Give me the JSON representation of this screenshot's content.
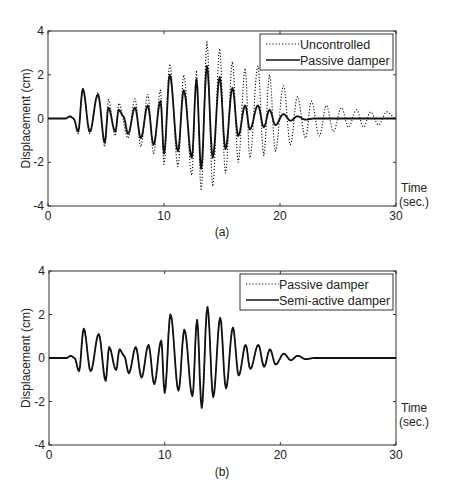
{
  "chart_data": [
    {
      "type": "line",
      "panel_label": "(a)",
      "title": "",
      "xlabel": "Time (sec.)",
      "xlabel_lines": [
        "Time",
        "(sec.)"
      ],
      "ylabel": "Displacement (cm)",
      "xlim": [
        0,
        30
      ],
      "ylim": [
        -4,
        4
      ],
      "xticks": [
        0,
        10,
        20,
        30
      ],
      "yticks": [
        -4,
        -2,
        0,
        2,
        4
      ],
      "grid": false,
      "legend_position": "upper right",
      "series": [
        {
          "name": "Uncontrolled",
          "style": "dotted",
          "peaks": [
            [
              0,
              0
            ],
            [
              1.5,
              0
            ],
            [
              1.9,
              0.1
            ],
            [
              2.2,
              0
            ],
            [
              2.6,
              -0.7
            ],
            [
              3.0,
              1.4
            ],
            [
              3.6,
              -0.7
            ],
            [
              4.3,
              1.2
            ],
            [
              4.9,
              -1.3
            ],
            [
              5.2,
              0.9
            ],
            [
              5.8,
              -0.8
            ],
            [
              6.1,
              0.7
            ],
            [
              6.9,
              -0.9
            ],
            [
              7.5,
              0.9
            ],
            [
              8.0,
              -1.3
            ],
            [
              8.6,
              1.1
            ],
            [
              9.1,
              -1.6
            ],
            [
              9.7,
              1.3
            ],
            [
              10.0,
              -2.1
            ],
            [
              10.5,
              2.5
            ],
            [
              11.2,
              -2.2
            ],
            [
              11.7,
              2.0
            ],
            [
              12.4,
              -2.6
            ],
            [
              12.8,
              2.2
            ],
            [
              13.2,
              -3.3
            ],
            [
              13.7,
              3.5
            ],
            [
              14.2,
              -3.1
            ],
            [
              14.8,
              3.2
            ],
            [
              15.3,
              -2.5
            ],
            [
              15.9,
              2.6
            ],
            [
              16.4,
              -2.0
            ],
            [
              17.0,
              2.3
            ],
            [
              17.4,
              -1.8
            ],
            [
              18.1,
              2.4
            ],
            [
              18.6,
              -1.7
            ],
            [
              19.1,
              2.0
            ],
            [
              19.6,
              -1.5
            ],
            [
              20.3,
              1.5
            ],
            [
              20.9,
              -1.2
            ],
            [
              21.5,
              1.0
            ],
            [
              22.2,
              -0.9
            ],
            [
              22.7,
              0.8
            ],
            [
              23.4,
              -0.8
            ],
            [
              24.0,
              0.6
            ],
            [
              24.6,
              -0.6
            ],
            [
              25.3,
              0.5
            ],
            [
              25.9,
              -0.4
            ],
            [
              26.6,
              0.4
            ],
            [
              27.2,
              -0.4
            ],
            [
              27.8,
              0.3
            ],
            [
              28.5,
              -0.3
            ],
            [
              29.2,
              0.3
            ],
            [
              30,
              0
            ]
          ]
        },
        {
          "name": "Passive damper",
          "style": "solid",
          "peaks": [
            [
              0,
              0
            ],
            [
              1.5,
              0
            ],
            [
              1.9,
              0.1
            ],
            [
              2.2,
              0
            ],
            [
              2.6,
              -0.6
            ],
            [
              3.0,
              1.35
            ],
            [
              3.6,
              -0.6
            ],
            [
              4.3,
              1.1
            ],
            [
              4.9,
              -1.1
            ],
            [
              5.2,
              0.5
            ],
            [
              5.8,
              -0.6
            ],
            [
              6.1,
              0.4
            ],
            [
              6.5,
              0.1
            ],
            [
              6.9,
              -0.7
            ],
            [
              7.5,
              0.5
            ],
            [
              8.0,
              -0.9
            ],
            [
              8.6,
              0.6
            ],
            [
              9.1,
              -1.2
            ],
            [
              9.7,
              0.8
            ],
            [
              10.0,
              -1.6
            ],
            [
              10.5,
              2.0
            ],
            [
              11.2,
              -1.5
            ],
            [
              11.7,
              1.3
            ],
            [
              12.4,
              -1.8
            ],
            [
              12.8,
              1.8
            ],
            [
              13.2,
              -2.3
            ],
            [
              13.7,
              2.4
            ],
            [
              14.2,
              -1.8
            ],
            [
              14.8,
              1.9
            ],
            [
              15.3,
              -1.4
            ],
            [
              15.9,
              1.4
            ],
            [
              16.4,
              -0.8
            ],
            [
              17.0,
              0.6
            ],
            [
              17.4,
              -0.5
            ],
            [
              18.1,
              0.6
            ],
            [
              18.6,
              -0.4
            ],
            [
              19.1,
              0.4
            ],
            [
              19.6,
              -0.3
            ],
            [
              20.3,
              0.2
            ],
            [
              20.9,
              -0.1
            ],
            [
              21.5,
              0.1
            ],
            [
              22.2,
              -0.05
            ],
            [
              23,
              0
            ],
            [
              30,
              0
            ]
          ]
        }
      ]
    },
    {
      "type": "line",
      "panel_label": "(b)",
      "title": "",
      "xlabel": "Time (sec.)",
      "xlabel_lines": [
        "Time",
        "(sec.)"
      ],
      "ylabel": "Displacement (cm)",
      "xlim": [
        0,
        30
      ],
      "ylim": [
        -4,
        4
      ],
      "xticks": [
        0,
        10,
        20,
        30
      ],
      "yticks": [
        -4,
        -2,
        0,
        2,
        4
      ],
      "grid": false,
      "legend_position": "upper right",
      "series": [
        {
          "name": "Passive damper",
          "style": "dotted",
          "peaks": [
            [
              0,
              0
            ],
            [
              1.5,
              0
            ],
            [
              1.9,
              0.1
            ],
            [
              2.2,
              0
            ],
            [
              2.6,
              -0.6
            ],
            [
              3.0,
              1.35
            ],
            [
              3.6,
              -0.6
            ],
            [
              4.3,
              1.1
            ],
            [
              4.9,
              -1.05
            ],
            [
              5.2,
              0.5
            ],
            [
              5.8,
              -0.55
            ],
            [
              6.1,
              0.4
            ],
            [
              6.5,
              0.1
            ],
            [
              6.9,
              -0.7
            ],
            [
              7.5,
              0.5
            ],
            [
              8.0,
              -0.9
            ],
            [
              8.6,
              0.6
            ],
            [
              9.1,
              -1.2
            ],
            [
              9.7,
              0.8
            ],
            [
              10.0,
              -1.6
            ],
            [
              10.5,
              2.0
            ],
            [
              11.2,
              -1.5
            ],
            [
              11.7,
              1.3
            ],
            [
              12.4,
              -1.75
            ],
            [
              12.8,
              1.75
            ],
            [
              13.2,
              -2.3
            ],
            [
              13.7,
              2.35
            ],
            [
              14.2,
              -1.8
            ],
            [
              14.8,
              1.85
            ],
            [
              15.3,
              -1.4
            ],
            [
              15.9,
              1.4
            ],
            [
              16.4,
              -0.8
            ],
            [
              17.0,
              0.6
            ],
            [
              17.4,
              -0.5
            ],
            [
              18.1,
              0.6
            ],
            [
              18.6,
              -0.4
            ],
            [
              19.1,
              0.4
            ],
            [
              19.6,
              -0.3
            ],
            [
              20.3,
              0.2
            ],
            [
              20.9,
              -0.1
            ],
            [
              21.5,
              0.1
            ],
            [
              22.2,
              -0.05
            ],
            [
              23,
              0
            ],
            [
              30,
              0
            ]
          ]
        },
        {
          "name": "Semi-active damper",
          "style": "solid",
          "peaks": [
            [
              0,
              0
            ],
            [
              1.5,
              0
            ],
            [
              1.9,
              0.1
            ],
            [
              2.2,
              0
            ],
            [
              2.6,
              -0.6
            ],
            [
              3.0,
              1.35
            ],
            [
              3.6,
              -0.6
            ],
            [
              4.3,
              1.1
            ],
            [
              4.9,
              -1.05
            ],
            [
              5.2,
              0.5
            ],
            [
              5.8,
              -0.55
            ],
            [
              6.1,
              0.4
            ],
            [
              6.5,
              0.1
            ],
            [
              6.9,
              -0.7
            ],
            [
              7.5,
              0.5
            ],
            [
              8.0,
              -0.9
            ],
            [
              8.6,
              0.6
            ],
            [
              9.1,
              -1.2
            ],
            [
              9.7,
              0.8
            ],
            [
              10.0,
              -1.6
            ],
            [
              10.5,
              2.0
            ],
            [
              11.2,
              -1.5
            ],
            [
              11.7,
              1.3
            ],
            [
              12.4,
              -1.75
            ],
            [
              12.8,
              1.75
            ],
            [
              13.2,
              -2.3
            ],
            [
              13.7,
              2.35
            ],
            [
              14.2,
              -1.8
            ],
            [
              14.8,
              1.85
            ],
            [
              15.3,
              -1.4
            ],
            [
              15.9,
              1.4
            ],
            [
              16.4,
              -0.8
            ],
            [
              17.0,
              0.6
            ],
            [
              17.4,
              -0.5
            ],
            [
              18.1,
              0.6
            ],
            [
              18.6,
              -0.4
            ],
            [
              19.1,
              0.4
            ],
            [
              19.6,
              -0.3
            ],
            [
              20.3,
              0.2
            ],
            [
              20.9,
              -0.1
            ],
            [
              21.5,
              0.1
            ],
            [
              22.2,
              -0.05
            ],
            [
              23,
              0
            ],
            [
              30,
              0
            ]
          ]
        }
      ]
    }
  ],
  "panels": [
    {
      "id": "a",
      "label": "(a)",
      "ylabel": "Displacement (cm)",
      "time_label_1": "Time",
      "time_label_2": "(sec.)",
      "legend": [
        "Uncontrolled",
        "Passive damper"
      ]
    },
    {
      "id": "b",
      "label": "(b)",
      "ylabel": "Displacement (cm)",
      "time_label_1": "Time",
      "time_label_2": "(sec.)",
      "legend": [
        "Passive damper",
        "Semi-active damper"
      ]
    }
  ],
  "colors": {
    "line": "#111111",
    "axis": "#333333",
    "background": "#ffffff"
  }
}
